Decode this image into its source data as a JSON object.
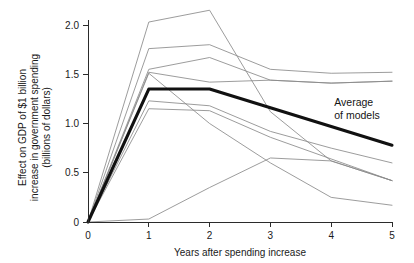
{
  "chart_data": {
    "type": "line",
    "title": "",
    "xlabel": "Years after spending increase",
    "ylabel": "Effect on GDP of $1 billion increase in government spending (billions of dollars)",
    "ylabel_lines": [
      "Effect on GDP of $1 billion",
      "increase in government spending",
      "(billions of dollars)"
    ],
    "x": [
      0,
      1,
      2,
      3,
      4,
      5
    ],
    "xlim": [
      0,
      5
    ],
    "ylim": [
      0,
      2.2
    ],
    "xticks": [
      "0",
      "1",
      "2",
      "3",
      "4",
      "5"
    ],
    "yticks": [
      "0",
      "0.5",
      "1.0",
      "1.5",
      "2.0"
    ],
    "ytick_values": [
      0,
      0.5,
      1.0,
      1.5,
      2.0
    ],
    "grid": false,
    "legend": "none",
    "annotations": [
      {
        "name": "average-of-models",
        "lines": [
          "Average",
          "of models"
        ],
        "x": 4.05,
        "y": 1.18
      }
    ],
    "series": [
      {
        "name": "model-1",
        "style": "thin-gray",
        "values": [
          0,
          2.03,
          2.15,
          1.12,
          0.62,
          0.42
        ]
      },
      {
        "name": "model-2",
        "style": "thin-gray",
        "values": [
          0,
          1.76,
          1.8,
          1.55,
          1.51,
          1.52
        ]
      },
      {
        "name": "model-3",
        "style": "thin-gray",
        "values": [
          0,
          1.55,
          1.67,
          1.44,
          1.41,
          1.43
        ]
      },
      {
        "name": "model-4",
        "style": "thin-gray",
        "values": [
          0,
          1.52,
          1.42,
          1.44,
          1.41,
          1.43
        ]
      },
      {
        "name": "model-5",
        "style": "thin-gray",
        "values": [
          0,
          1.51,
          1.0,
          0.6,
          0.25,
          0.17
        ]
      },
      {
        "name": "model-6",
        "style": "thin-gray",
        "values": [
          0,
          1.23,
          1.18,
          0.92,
          0.75,
          0.6
        ]
      },
      {
        "name": "model-7",
        "style": "thin-gray",
        "values": [
          0,
          1.15,
          1.13,
          0.86,
          0.64,
          0.42
        ]
      },
      {
        "name": "model-8",
        "style": "thin-gray",
        "values": [
          0,
          0.03,
          0.35,
          0.65,
          0.62,
          0.42
        ]
      },
      {
        "name": "average-of-models",
        "style": "thick-black",
        "values": [
          0,
          1.35,
          1.35,
          1.16,
          0.97,
          0.78
        ]
      }
    ]
  },
  "figure": {
    "background": "#ffffff",
    "line_color": "#8a8a8a",
    "average_color": "#111111",
    "axis_color": "#2b2b2b"
  }
}
